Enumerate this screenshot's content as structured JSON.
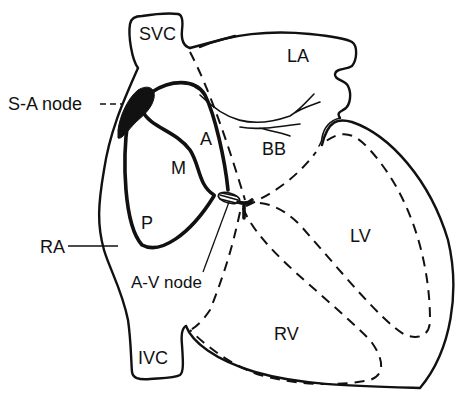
{
  "diagram": {
    "labels": {
      "svc": "SVC",
      "la": "LA",
      "sa_node": "S-A node",
      "anterior": "A",
      "bb": "BB",
      "middle": "M",
      "posterior": "P",
      "ra": "RA",
      "lv": "LV",
      "av_node": "A-V node",
      "rv": "RV",
      "ivc": "IVC"
    },
    "colors": {
      "stroke": "#111111",
      "background": "#ffffff"
    }
  }
}
